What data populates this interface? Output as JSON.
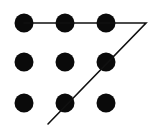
{
  "diagram": {
    "type": "nine-dots-puzzle",
    "background": "#ffffff",
    "dot_color": "#0a0a0a",
    "line_color": "#111111",
    "dot_radius": 9.5,
    "dots": [
      {
        "row": 1,
        "col": 1,
        "cx": 24,
        "cy": 23
      },
      {
        "row": 1,
        "col": 2,
        "cx": 65,
        "cy": 23
      },
      {
        "row": 1,
        "col": 3,
        "cx": 106,
        "cy": 23
      },
      {
        "row": 2,
        "col": 1,
        "cx": 24,
        "cy": 62
      },
      {
        "row": 2,
        "col": 2,
        "cx": 65,
        "cy": 62
      },
      {
        "row": 2,
        "col": 3,
        "cx": 106,
        "cy": 62
      },
      {
        "row": 3,
        "col": 1,
        "cx": 24,
        "cy": 103
      },
      {
        "row": 3,
        "col": 2,
        "cx": 65,
        "cy": 103
      },
      {
        "row": 3,
        "col": 3,
        "cx": 106,
        "cy": 103
      }
    ],
    "path": [
      {
        "x": 24,
        "y": 23
      },
      {
        "x": 146,
        "y": 23
      },
      {
        "x": 48,
        "y": 124
      }
    ]
  }
}
